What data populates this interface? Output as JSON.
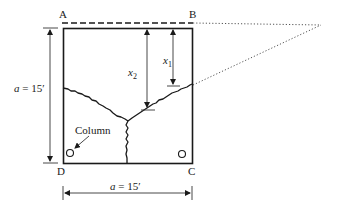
{
  "diagram": {
    "corners": {
      "top_left": "A",
      "top_right": "B",
      "bottom_right": "C",
      "bottom_left": "D"
    },
    "dimensions": {
      "side_vertical": {
        "var": "a",
        "eq": " = 15′"
      },
      "side_horizontal": {
        "var": "a",
        "eq": " = 15′"
      },
      "x1": {
        "var": "x",
        "sub": "1"
      },
      "x2": {
        "var": "x",
        "sub": "2"
      }
    },
    "annotations": {
      "column_label": "Column"
    },
    "colors": {
      "line": "#1a1a1a",
      "dim_line": "#333333",
      "background": "#ffffff"
    }
  }
}
